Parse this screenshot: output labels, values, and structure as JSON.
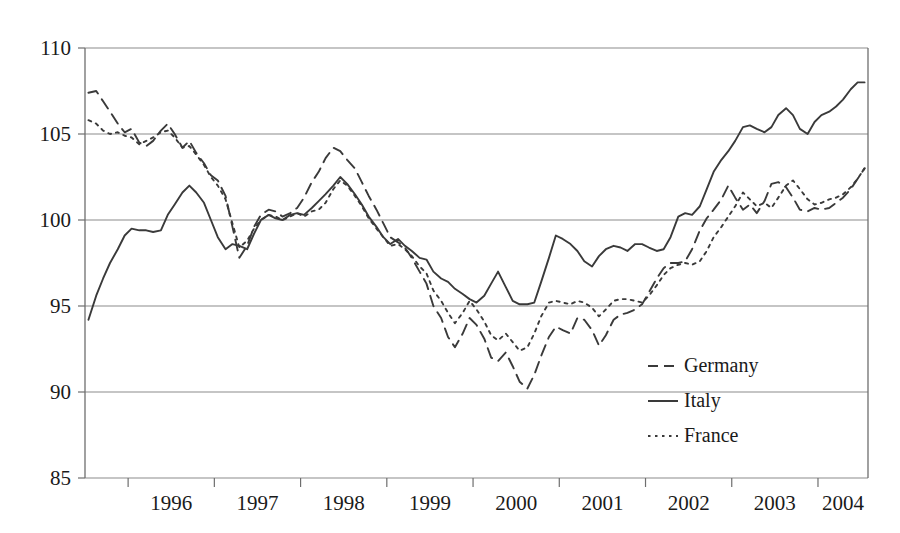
{
  "chart_data": {
    "type": "line",
    "title": "",
    "xlabel": "",
    "ylabel": "",
    "ylim": [
      85,
      110
    ],
    "yticks": [
      85,
      90,
      95,
      100,
      105,
      110
    ],
    "ytick_labels": [
      "85",
      "90",
      "95",
      "100",
      "105",
      "110"
    ],
    "grid": true,
    "grid_axis": "y",
    "xlim": [
      1995.5,
      2004.58
    ],
    "xticks": [
      1996,
      1997,
      1998,
      1999,
      2000,
      2001,
      2002,
      2003,
      2004
    ],
    "xtick_labels": [
      "1996",
      "1997",
      "1998",
      "1999",
      "2000",
      "2001",
      "2002",
      "2003",
      "2004"
    ],
    "legend_position": "bottom-right",
    "legend_entries": [
      "Germany",
      "Italy",
      "France"
    ],
    "series": [
      {
        "name": "Germany",
        "style": "dashed",
        "color": "#3a3a3a",
        "x": [
          1995.54,
          1995.63,
          1995.71,
          1995.79,
          1995.88,
          1995.96,
          1996.04,
          1996.13,
          1996.21,
          1996.29,
          1996.38,
          1996.46,
          1996.54,
          1996.63,
          1996.71,
          1996.79,
          1996.88,
          1996.96,
          1997.04,
          1997.13,
          1997.21,
          1997.29,
          1997.38,
          1997.46,
          1997.54,
          1997.63,
          1997.71,
          1997.79,
          1997.88,
          1997.96,
          1998.04,
          1998.13,
          1998.21,
          1998.29,
          1998.38,
          1998.46,
          1998.54,
          1998.63,
          1998.71,
          1998.79,
          1998.88,
          1998.96,
          1999.04,
          1999.13,
          1999.21,
          1999.29,
          1999.38,
          1999.46,
          1999.54,
          1999.63,
          1999.71,
          1999.79,
          1999.88,
          1999.96,
          2000.04,
          2000.13,
          2000.21,
          2000.29,
          2000.38,
          2000.46,
          2000.54,
          2000.63,
          2000.71,
          2000.79,
          2000.88,
          2000.96,
          2001.04,
          2001.13,
          2001.21,
          2001.29,
          2001.38,
          2001.46,
          2001.54,
          2001.63,
          2001.71,
          2001.79,
          2001.88,
          2001.96,
          2002.04,
          2002.13,
          2002.21,
          2002.29,
          2002.38,
          2002.46,
          2002.54,
          2002.63,
          2002.71,
          2002.79,
          2002.88,
          2002.96,
          2003.04,
          2003.13,
          2003.21,
          2003.29,
          2003.38,
          2003.46,
          2003.54,
          2003.63,
          2003.71,
          2003.79,
          2003.88,
          2003.96,
          2004.04,
          2004.13,
          2004.21,
          2004.29,
          2004.38,
          2004.46,
          2004.54
        ],
        "y": [
          107.4,
          107.5,
          106.9,
          106.3,
          105.6,
          105.1,
          105.3,
          104.5,
          104.3,
          104.6,
          105.2,
          105.6,
          105.0,
          104.2,
          104.6,
          103.9,
          103.3,
          102.6,
          102.3,
          101.4,
          99.6,
          97.8,
          98.5,
          99.6,
          100.3,
          100.6,
          100.5,
          100.2,
          100.4,
          100.7,
          101.3,
          102.2,
          102.8,
          103.6,
          104.2,
          104.0,
          103.5,
          103.0,
          102.2,
          101.4,
          100.6,
          99.8,
          99.0,
          98.7,
          98.4,
          97.8,
          97.0,
          96.3,
          95.0,
          94.3,
          93.2,
          92.6,
          93.4,
          94.3,
          93.9,
          93.1,
          92.0,
          91.8,
          92.3,
          91.5,
          90.6,
          90.2,
          91.0,
          92.1,
          93.2,
          93.8,
          93.6,
          93.4,
          94.3,
          94.2,
          93.6,
          92.7,
          93.3,
          94.2,
          94.5,
          94.6,
          94.8,
          95.1,
          95.8,
          96.6,
          97.2,
          97.5,
          97.5,
          97.6,
          98.3,
          99.4,
          100.1,
          100.6,
          101.2,
          102.0,
          101.3,
          100.6,
          100.9,
          100.4,
          101.1,
          102.1,
          102.2,
          101.9,
          101.3,
          100.6,
          100.5,
          100.7,
          100.6,
          100.7,
          101.0,
          101.3,
          101.8,
          102.4,
          103.0
        ]
      },
      {
        "name": "Italy",
        "style": "solid",
        "color": "#3a3a3a",
        "x": [
          1995.54,
          1995.63,
          1995.71,
          1995.79,
          1995.88,
          1995.96,
          1996.04,
          1996.13,
          1996.21,
          1996.29,
          1996.38,
          1996.46,
          1996.54,
          1996.63,
          1996.71,
          1996.79,
          1996.88,
          1996.96,
          1997.04,
          1997.13,
          1997.21,
          1997.29,
          1997.38,
          1997.46,
          1997.54,
          1997.63,
          1997.71,
          1997.79,
          1997.88,
          1997.96,
          1998.04,
          1998.13,
          1998.21,
          1998.29,
          1998.38,
          1998.46,
          1998.54,
          1998.63,
          1998.71,
          1998.79,
          1998.88,
          1998.96,
          1999.04,
          1999.13,
          1999.21,
          1999.29,
          1999.38,
          1999.46,
          1999.54,
          1999.63,
          1999.71,
          1999.79,
          1999.88,
          1999.96,
          2000.04,
          2000.13,
          2000.21,
          2000.29,
          2000.38,
          2000.46,
          2000.54,
          2000.63,
          2000.71,
          2000.79,
          2000.88,
          2000.96,
          2001.04,
          2001.13,
          2001.21,
          2001.29,
          2001.38,
          2001.46,
          2001.54,
          2001.63,
          2001.71,
          2001.79,
          2001.88,
          2001.96,
          2002.04,
          2002.13,
          2002.21,
          2002.29,
          2002.38,
          2002.46,
          2002.54,
          2002.63,
          2002.71,
          2002.79,
          2002.88,
          2002.96,
          2003.04,
          2003.13,
          2003.21,
          2003.29,
          2003.38,
          2003.46,
          2003.54,
          2003.63,
          2003.71,
          2003.79,
          2003.88,
          2003.96,
          2004.04,
          2004.13,
          2004.21,
          2004.29,
          2004.38,
          2004.46,
          2004.54
        ],
        "y": [
          94.2,
          95.6,
          96.6,
          97.5,
          98.3,
          99.1,
          99.5,
          99.4,
          99.4,
          99.3,
          99.4,
          100.3,
          100.9,
          101.6,
          102.0,
          101.6,
          101.0,
          100.0,
          99.0,
          98.3,
          98.6,
          98.5,
          98.3,
          99.2,
          100.0,
          100.3,
          100.1,
          100.0,
          100.3,
          100.4,
          100.3,
          100.7,
          101.1,
          101.5,
          102.0,
          102.5,
          102.1,
          101.5,
          100.9,
          100.2,
          99.6,
          99.0,
          98.6,
          98.9,
          98.5,
          98.2,
          97.8,
          97.7,
          97.0,
          96.6,
          96.4,
          96.0,
          95.7,
          95.4,
          95.2,
          95.6,
          96.3,
          97.0,
          96.1,
          95.3,
          95.1,
          95.1,
          95.2,
          96.4,
          97.8,
          99.1,
          98.9,
          98.6,
          98.2,
          97.6,
          97.3,
          97.9,
          98.3,
          98.5,
          98.4,
          98.2,
          98.6,
          98.6,
          98.4,
          98.2,
          98.3,
          99.0,
          100.2,
          100.4,
          100.3,
          100.8,
          101.8,
          102.8,
          103.5,
          104.0,
          104.6,
          105.4,
          105.5,
          105.3,
          105.1,
          105.4,
          106.1,
          106.5,
          106.1,
          105.3,
          105.0,
          105.7,
          106.1,
          106.3,
          106.6,
          107.0,
          107.6,
          108.0,
          108.0
        ]
      },
      {
        "name": "France",
        "style": "dotted",
        "color": "#3a3a3a",
        "x": [
          1995.54,
          1995.63,
          1995.71,
          1995.79,
          1995.88,
          1995.96,
          1996.04,
          1996.13,
          1996.21,
          1996.29,
          1996.38,
          1996.46,
          1996.54,
          1996.63,
          1996.71,
          1996.79,
          1996.88,
          1996.96,
          1997.04,
          1997.13,
          1997.21,
          1997.29,
          1997.38,
          1997.46,
          1997.54,
          1997.63,
          1997.71,
          1997.79,
          1997.88,
          1997.96,
          1998.04,
          1998.13,
          1998.21,
          1998.29,
          1998.38,
          1998.46,
          1998.54,
          1998.63,
          1998.71,
          1998.79,
          1998.88,
          1998.96,
          1999.04,
          1999.13,
          1999.21,
          1999.29,
          1999.38,
          1999.46,
          1999.54,
          1999.63,
          1999.71,
          1999.79,
          1999.88,
          1999.96,
          2000.04,
          2000.13,
          2000.21,
          2000.29,
          2000.38,
          2000.46,
          2000.54,
          2000.63,
          2000.71,
          2000.79,
          2000.88,
          2000.96,
          2001.04,
          2001.13,
          2001.21,
          2001.29,
          2001.38,
          2001.46,
          2001.54,
          2001.63,
          2001.71,
          2001.79,
          2001.88,
          2001.96,
          2002.04,
          2002.13,
          2002.21,
          2002.29,
          2002.38,
          2002.46,
          2002.54,
          2002.63,
          2002.71,
          2002.79,
          2002.88,
          2002.96,
          2003.04,
          2003.13,
          2003.21,
          2003.29,
          2003.38,
          2003.46,
          2003.54,
          2003.63,
          2003.71,
          2003.79,
          2003.88,
          2003.96,
          2004.04,
          2004.13,
          2004.21,
          2004.29,
          2004.38,
          2004.46,
          2004.54
        ],
        "y": [
          105.8,
          105.6,
          105.2,
          105.0,
          105.1,
          104.9,
          104.8,
          104.4,
          104.6,
          104.8,
          105.1,
          105.2,
          104.8,
          104.2,
          104.3,
          103.8,
          103.2,
          102.5,
          102.0,
          101.2,
          99.8,
          98.4,
          98.8,
          99.5,
          100.0,
          100.3,
          100.2,
          100.0,
          100.2,
          100.4,
          100.2,
          100.5,
          100.6,
          101.0,
          101.8,
          102.3,
          102.0,
          101.4,
          100.8,
          100.1,
          99.5,
          99.0,
          98.5,
          98.6,
          98.3,
          97.9,
          97.3,
          96.9,
          95.9,
          95.3,
          94.6,
          94.0,
          94.6,
          95.3,
          94.8,
          94.1,
          93.3,
          93.0,
          93.4,
          92.9,
          92.4,
          92.6,
          93.4,
          94.4,
          95.2,
          95.3,
          95.2,
          95.1,
          95.3,
          95.2,
          94.9,
          94.4,
          94.8,
          95.3,
          95.4,
          95.4,
          95.3,
          95.2,
          95.6,
          96.2,
          96.8,
          97.2,
          97.4,
          97.5,
          97.4,
          97.6,
          98.2,
          99.0,
          99.6,
          100.2,
          100.8,
          101.6,
          101.2,
          100.8,
          101.0,
          100.7,
          101.3,
          102.0,
          102.3,
          101.8,
          101.2,
          100.9,
          101.0,
          101.2,
          101.3,
          101.5,
          101.9,
          102.4,
          103.0
        ]
      }
    ]
  },
  "legend": {
    "items": [
      {
        "label": "Germany",
        "style": "dashed"
      },
      {
        "label": "Italy",
        "style": "solid"
      },
      {
        "label": "France",
        "style": "dotted"
      }
    ]
  },
  "axes": {
    "y_labels": [
      "110",
      "105",
      "100",
      "95",
      "90",
      "85"
    ],
    "x_labels": [
      "1996",
      "1997",
      "1998",
      "1999",
      "2000",
      "2001",
      "2002",
      "2003",
      "2004"
    ]
  }
}
